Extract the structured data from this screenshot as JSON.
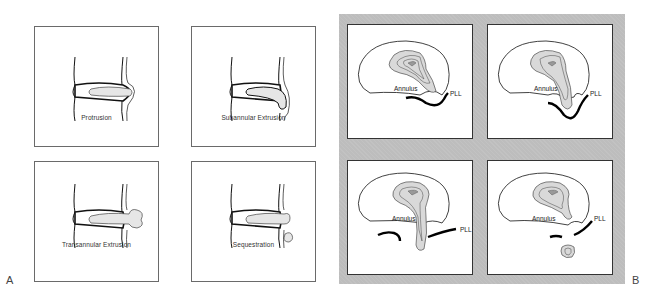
{
  "figure": {
    "panel_a": {
      "letter": "A",
      "diagrams": [
        {
          "caption": "Protrusion"
        },
        {
          "caption": "Subannular Extrusion"
        },
        {
          "caption": "Transannular Extrusion"
        },
        {
          "caption": "Sequestration"
        }
      ]
    },
    "panel_b": {
      "letter": "B",
      "diagrams": [
        {
          "label_annulus": "Annulus",
          "label_pll": "PLL"
        },
        {
          "label_annulus": "Annulus",
          "label_pll": "PLL"
        },
        {
          "label_annulus": "Annulus",
          "label_pll": "PLL"
        },
        {
          "label_annulus": "Annulus",
          "label_pll": "PLL"
        }
      ],
      "background_color": "#bdbdbd"
    }
  }
}
